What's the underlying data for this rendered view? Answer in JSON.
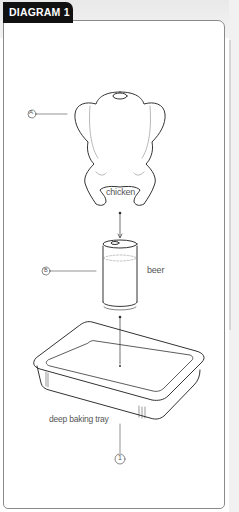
{
  "header": {
    "tab_label": "DIAGRAM 1"
  },
  "diagram": {
    "items": [
      {
        "marker": "A",
        "label": "chicken"
      },
      {
        "marker": "B",
        "label": "beer"
      },
      {
        "marker": "1",
        "label": "deep baking tray"
      }
    ]
  },
  "colors": {
    "tab_bg": "#111111",
    "line": "#333333",
    "border": "#8a8a8a"
  }
}
